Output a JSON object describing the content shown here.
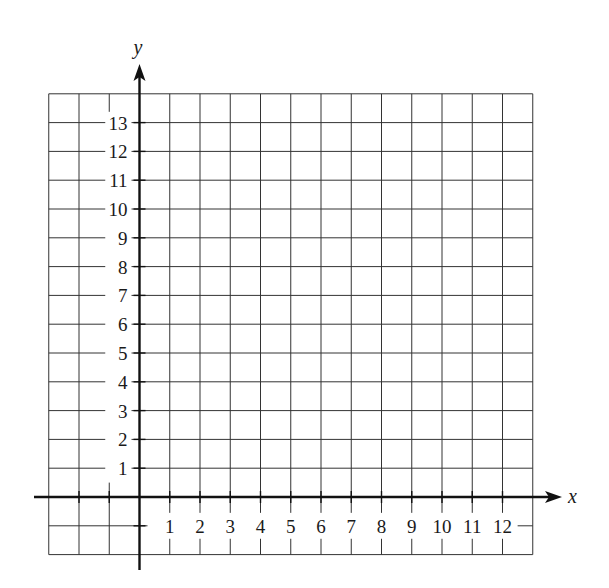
{
  "chart_data": {
    "type": "table",
    "title": "",
    "xlabel": "x",
    "ylabel": "y",
    "xlim": [
      -3,
      13
    ],
    "ylim": [
      -2,
      14
    ],
    "grid": true,
    "x_ticks": [
      1,
      2,
      3,
      4,
      5,
      6,
      7,
      8,
      9,
      10,
      11,
      12
    ],
    "y_ticks": [
      1,
      2,
      3,
      4,
      5,
      6,
      7,
      8,
      9,
      10,
      11,
      12,
      13
    ],
    "x_tick_labels": [
      "1",
      "2",
      "3",
      "4",
      "5",
      "6",
      "7",
      "8",
      "9",
      "10",
      "11",
      "12"
    ],
    "y_tick_labels": [
      "1",
      "2",
      "3",
      "4",
      "5",
      "6",
      "7",
      "8",
      "9",
      "10",
      "11",
      "12",
      "13"
    ],
    "series": []
  },
  "layout": {
    "origin_px": [
      139.5,
      497
    ],
    "unit_x_px": 30.25,
    "unit_y_px": 28.8,
    "axis_x_extent_px": [
      34,
      562
    ],
    "axis_y_extent_px": [
      64,
      570
    ],
    "colors": {
      "grid": "#333333",
      "axis": "#111111",
      "text": "#1a1a1a",
      "background": "#ffffff"
    }
  }
}
